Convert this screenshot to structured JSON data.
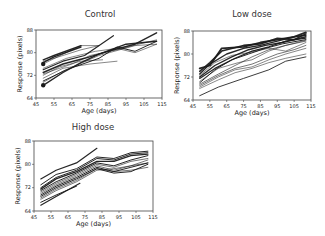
{
  "figure": {
    "width": 325,
    "height": 236,
    "background": "#ffffff",
    "line_color": "#1a1a1a"
  },
  "chart_data": [
    {
      "type": "line",
      "title": "Control",
      "xlabel": "Age (days)",
      "ylabel": "Response (pixels)",
      "xlim": [
        45,
        115
      ],
      "ylim": [
        64,
        88
      ],
      "xticks": [
        45,
        55,
        65,
        75,
        85,
        95,
        105,
        115
      ],
      "xtick_labels": [
        "45",
        "55",
        "65",
        "75",
        "85",
        "95",
        "105",
        "115"
      ],
      "yticks": [
        64,
        72,
        80,
        88
      ],
      "ytick_labels": [
        "64",
        "72",
        "80",
        "88"
      ],
      "grid": false,
      "legend": null,
      "note": "Traces are hand-estimated approximations of visible trends; individual trajectories are not legible at this resolution.",
      "box": {
        "x0": 36,
        "y0": 30,
        "x1": 162,
        "y1": 98
      },
      "markers": [
        {
          "x": 49,
          "y": 76,
          "shape": "filled-circle"
        },
        {
          "x": 49,
          "y": 68.5,
          "shape": "filled-circle"
        }
      ],
      "series": [
        {
          "x": [
            49,
            55,
            70
          ],
          "y": [
            77.5,
            79,
            82.5
          ],
          "w": 1.4
        },
        {
          "x": [
            49,
            55,
            70
          ],
          "y": [
            76.5,
            78.5,
            82
          ],
          "w": 1.4
        },
        {
          "x": [
            49,
            55,
            70,
            80
          ],
          "y": [
            77,
            78,
            81,
            82.5
          ],
          "w": 0.7
        },
        {
          "x": [
            49,
            60,
            70,
            80
          ],
          "y": [
            76,
            79.5,
            82.5,
            82.5
          ],
          "w": 0.7
        },
        {
          "x": [
            49,
            60,
            72,
            88
          ],
          "y": [
            74,
            77,
            79,
            86
          ],
          "w": 1.2
        },
        {
          "x": [
            49,
            60,
            72,
            85,
            100,
            112
          ],
          "y": [
            73,
            76,
            78,
            80.5,
            83,
            87
          ],
          "w": 1.4
        },
        {
          "x": [
            49,
            58,
            70,
            82
          ],
          "y": [
            72,
            75,
            77,
            77.5
          ],
          "w": 0.7
        },
        {
          "x": [
            49,
            60,
            75,
            90
          ],
          "y": [
            71,
            74.5,
            76,
            77
          ],
          "w": 0.7
        },
        {
          "x": [
            49,
            62,
            80,
            90,
            100,
            112
          ],
          "y": [
            70,
            74,
            78,
            82,
            80.5,
            84
          ],
          "w": 1.0
        },
        {
          "x": [
            49,
            60,
            80,
            100,
            112
          ],
          "y": [
            69.5,
            73.5,
            79,
            82.5,
            83
          ],
          "w": 0.7
        },
        {
          "x": [
            49,
            60,
            70,
            80,
            95,
            112
          ],
          "y": [
            68.5,
            73,
            76.5,
            79.5,
            83,
            84
          ],
          "w": 1.4
        },
        {
          "x": [
            49,
            65,
            75,
            90,
            105,
            112
          ],
          "y": [
            72.5,
            76,
            79,
            81,
            83.5,
            84.5
          ],
          "w": 0.7
        },
        {
          "x": [
            49,
            62,
            78,
            90,
            100,
            112
          ],
          "y": [
            74.5,
            78,
            80.5,
            81.5,
            80,
            83
          ],
          "w": 0.7
        }
      ]
    },
    {
      "type": "line",
      "title": "Low dose",
      "xlabel": "Age (days)",
      "ylabel": "Response (pixels)",
      "xlim": [
        45,
        115
      ],
      "ylim": [
        64,
        88
      ],
      "xticks": [
        45,
        55,
        65,
        75,
        85,
        95,
        105,
        115
      ],
      "xtick_labels": [
        "45",
        "55",
        "65",
        "75",
        "85",
        "95",
        "105",
        "115"
      ],
      "yticks": [
        64,
        72,
        80,
        88
      ],
      "ytick_labels": [
        "64",
        "72",
        "80",
        "88"
      ],
      "grid": false,
      "legend": null,
      "note": "Traces are hand-estimated approximations of visible trends; individual trajectories are not legible at this resolution.",
      "box": {
        "x0": 193,
        "y0": 31,
        "x1": 311,
        "y1": 100
      },
      "series": [
        {
          "x": [
            49,
            55,
            62,
            75,
            85,
            95,
            105,
            112
          ],
          "y": [
            75,
            76,
            82,
            82.5,
            84,
            85,
            86,
            87.5
          ],
          "w": 1.8
        },
        {
          "x": [
            49,
            55,
            62,
            75,
            85,
            95,
            105,
            112
          ],
          "y": [
            74,
            77,
            81,
            83,
            83.5,
            85.5,
            85,
            87
          ],
          "w": 1.6
        },
        {
          "x": [
            49,
            55,
            65,
            75,
            85,
            95,
            105,
            112
          ],
          "y": [
            73,
            76.5,
            80,
            82,
            83,
            84.5,
            86,
            86.5
          ],
          "w": 1.4
        },
        {
          "x": [
            49,
            58,
            68,
            78,
            88,
            98,
            112
          ],
          "y": [
            72,
            76,
            79,
            81.5,
            83,
            84,
            86
          ],
          "w": 1.4
        },
        {
          "x": [
            49,
            58,
            70,
            80,
            90,
            100,
            112
          ],
          "y": [
            71.5,
            75,
            78.5,
            81,
            82.5,
            84.5,
            85.5
          ],
          "w": 1.2
        },
        {
          "x": [
            49,
            58,
            68,
            78,
            88,
            98,
            112
          ],
          "y": [
            70,
            74.5,
            78,
            80,
            82,
            83.5,
            85
          ],
          "w": 1.0
        },
        {
          "x": [
            49,
            60,
            70,
            80,
            90,
            100,
            112
          ],
          "y": [
            69.5,
            73,
            76,
            79,
            81.5,
            83,
            84.5
          ],
          "w": 0.8
        },
        {
          "x": [
            49,
            60,
            72,
            80,
            90,
            100,
            112
          ],
          "y": [
            70.5,
            75,
            77,
            78,
            81,
            83,
            84.8
          ],
          "w": 0.7
        },
        {
          "x": [
            49,
            58,
            68,
            78,
            90,
            100,
            112
          ],
          "y": [
            72.5,
            77,
            79.5,
            80.5,
            82,
            81,
            84
          ],
          "w": 0.7
        },
        {
          "x": [
            49,
            60,
            70,
            80,
            95,
            105,
            112
          ],
          "y": [
            69,
            72.5,
            75,
            76.5,
            80,
            81.5,
            83
          ],
          "w": 0.8
        },
        {
          "x": [
            49,
            60,
            70,
            80,
            90,
            100,
            112
          ],
          "y": [
            68.5,
            72,
            74.5,
            75.5,
            78,
            80,
            82
          ],
          "w": 0.7
        },
        {
          "x": [
            49,
            60,
            70,
            80,
            90,
            100,
            112
          ],
          "y": [
            68,
            71,
            73.5,
            75,
            77,
            78.5,
            80
          ],
          "w": 0.7
        },
        {
          "x": [
            49,
            60,
            75,
            90,
            100,
            112
          ],
          "y": [
            65.5,
            68.5,
            71.5,
            74.5,
            77.5,
            79
          ],
          "w": 0.9
        }
      ]
    },
    {
      "type": "line",
      "title": "High dose",
      "xlabel": "Age (days)",
      "ylabel": "Response (pixels)",
      "xlim": [
        45,
        115
      ],
      "ylim": [
        64,
        88
      ],
      "xticks": [
        45,
        55,
        65,
        75,
        85,
        95,
        105,
        115
      ],
      "xtick_labels": [
        "45",
        "55",
        "65",
        "75",
        "85",
        "95",
        "105",
        "115"
      ],
      "yticks": [
        64,
        72,
        80,
        88
      ],
      "ytick_labels": [
        "64",
        "72",
        "80",
        "88"
      ],
      "grid": false,
      "legend": null,
      "note": "Traces are hand-estimated approximations of visible trends; individual trajectories are not legible at this resolution.",
      "box": {
        "x0": 34,
        "y0": 141,
        "x1": 153,
        "y1": 211
      },
      "series": [
        {
          "x": [
            49,
            58,
            70,
            82
          ],
          "y": [
            75,
            78,
            80.5,
            85.5
          ],
          "w": 1.2
        },
        {
          "x": [
            49,
            58,
            70,
            82,
            92,
            102,
            112
          ],
          "y": [
            73,
            76.5,
            78.5,
            82.5,
            82,
            84,
            84.5
          ],
          "w": 1.0
        },
        {
          "x": [
            49,
            58,
            70,
            82,
            92,
            102,
            112
          ],
          "y": [
            72,
            75.5,
            78,
            82,
            81.5,
            83.5,
            84
          ],
          "w": 1.0
        },
        {
          "x": [
            49,
            58,
            70,
            82,
            92,
            102,
            112
          ],
          "y": [
            71.5,
            75,
            77.5,
            81,
            81,
            83,
            83.5
          ],
          "w": 1.4
        },
        {
          "x": [
            49,
            58,
            70,
            82,
            92,
            102,
            112
          ],
          "y": [
            71,
            74,
            77,
            80.5,
            79.5,
            81.5,
            83
          ],
          "w": 1.0
        },
        {
          "x": [
            49,
            58,
            70,
            82,
            92,
            102,
            112
          ],
          "y": [
            70.5,
            73.5,
            76.5,
            80,
            79,
            81,
            82
          ],
          "w": 0.8
        },
        {
          "x": [
            49,
            58,
            70,
            82,
            92,
            102,
            112
          ],
          "y": [
            70,
            73,
            76,
            79.5,
            78,
            79.5,
            81.5
          ],
          "w": 0.8
        },
        {
          "x": [
            49,
            58,
            70,
            82,
            92,
            102,
            112
          ],
          "y": [
            69.5,
            72.5,
            75.5,
            79,
            77.5,
            79,
            80.5
          ],
          "w": 1.0
        },
        {
          "x": [
            49,
            58,
            70,
            82,
            92,
            102,
            112
          ],
          "y": [
            69,
            72,
            75,
            78.5,
            77,
            77.5,
            80
          ],
          "w": 1.0
        },
        {
          "x": [
            49,
            58,
            70,
            82,
            92,
            102,
            112
          ],
          "y": [
            68.5,
            71.5,
            74.5,
            78.5,
            77.5,
            78,
            79
          ],
          "w": 0.8
        },
        {
          "x": [
            49,
            58,
            70,
            82,
            92,
            102,
            112
          ],
          "y": [
            68,
            71,
            74,
            78,
            78.5,
            79.5,
            80.5
          ],
          "w": 0.8
        },
        {
          "x": [
            49,
            58,
            70
          ],
          "y": [
            67,
            69.5,
            72.5
          ],
          "w": 1.0
        },
        {
          "x": [
            49,
            58,
            72
          ],
          "y": [
            66,
            69,
            73.5
          ],
          "w": 1.2
        }
      ]
    }
  ]
}
